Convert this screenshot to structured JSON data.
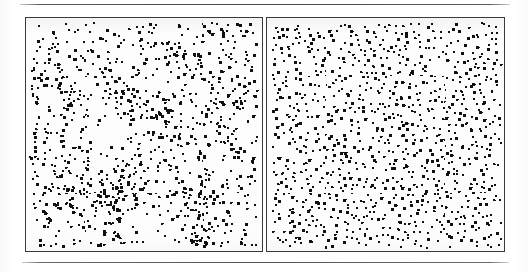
{
  "document": {
    "kind": "scanned-figure",
    "background_color": "#ffffff",
    "ink_color": "#1a1a1a",
    "rules": [
      {
        "name": "top-rule",
        "x": 20,
        "y": 4,
        "width": 490,
        "color": "#4a4a4a"
      },
      {
        "name": "bottom-rule",
        "x": 22,
        "y": 262,
        "width": 487,
        "color": "#575757"
      }
    ]
  },
  "figure": {
    "panel_count": 2,
    "caption": "",
    "panels": [
      {
        "id": "left",
        "name": "clustered-point-pattern",
        "label": "",
        "x": 25,
        "y": 17,
        "width": 238,
        "height": 235,
        "border_color": "#3a3a3a",
        "fill_color": "#fdfdfd",
        "point_color": "#111111",
        "point_count": 1180,
        "point_size_px": 2,
        "distribution": "clustered",
        "cluster_count": 46,
        "cluster_sigma_px": 17,
        "cluster_fraction": 0.72,
        "seed": 20947
      },
      {
        "id": "right",
        "name": "regular-point-pattern",
        "label": "",
        "x": 266,
        "y": 17,
        "width": 239,
        "height": 235,
        "border_color": "#3a3a3a",
        "fill_color": "#fdfdfd",
        "point_color": "#111111",
        "point_count": 1010,
        "point_size_px": 2,
        "distribution": "jittered-grid",
        "grid_cols": 36,
        "grid_rows": 36,
        "jitter_px": 3.1,
        "seed": 81533
      }
    ]
  },
  "chart_data": {
    "type": "scatter",
    "title": "",
    "xlabel": "",
    "ylabel": "",
    "grid": false,
    "legend": "none",
    "xlim": [
      0,
      1
    ],
    "ylim": [
      0,
      1
    ],
    "series": [
      {
        "name": "clustered-point-pattern",
        "panel": "left",
        "n": 1180,
        "pattern": "clustered",
        "marker": "square",
        "marker_size_px": 2,
        "color": "#111111",
        "description": "Spatial point pattern with strong aggregation: dense clumps separated by empty gaps."
      },
      {
        "name": "regular-point-pattern",
        "panel": "right",
        "n": 1010,
        "pattern": "regular",
        "marker": "square",
        "marker_size_px": 2,
        "color": "#111111",
        "description": "Spatial point pattern with near-even spacing: jittered lattice, few gaps or clumps."
      }
    ]
  }
}
